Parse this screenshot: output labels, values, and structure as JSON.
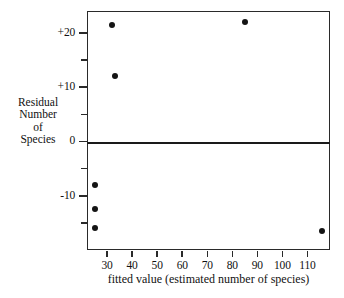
{
  "chart_data": {
    "type": "scatter",
    "title": "",
    "xlabel": "fitted value (estimated number of species)",
    "ylabel": "Residual Number of Species",
    "ylabel_lines": [
      "Residual",
      "Number",
      "of",
      "Species"
    ],
    "xlim": [
      22,
      119
    ],
    "ylim": [
      -20,
      24
    ],
    "grid": false,
    "legend": null,
    "zero_line": 0,
    "x_ticks": [
      30,
      40,
      50,
      60,
      70,
      80,
      90,
      100,
      110
    ],
    "x_tick_labels": [
      "30",
      "40",
      "50",
      "60",
      "70",
      "80",
      "90",
      "100",
      "110"
    ],
    "y_ticks": [
      20,
      15,
      10,
      5,
      0,
      -5,
      -10,
      -15
    ],
    "y_tick_labels": [
      "+20",
      "",
      "+10",
      "",
      "0",
      "",
      "-10",
      ""
    ],
    "y_labeled_ticks": [
      {
        "value": 20,
        "label": "+20"
      },
      {
        "value": 10,
        "label": "+10"
      },
      {
        "value": 0,
        "label": "0"
      },
      {
        "value": -10,
        "label": "-10"
      }
    ],
    "points": [
      {
        "x": 32,
        "y": 21.5
      },
      {
        "x": 85,
        "y": 22.0
      },
      {
        "x": 33,
        "y": 12.0
      },
      {
        "x": 25,
        "y": -8.0
      },
      {
        "x": 25,
        "y": -12.5
      },
      {
        "x": 25,
        "y": -16.0
      },
      {
        "x": 116,
        "y": -16.5
      }
    ],
    "colors": {
      "point": "#141414",
      "axis": "#2a2a2a",
      "zero_line": "#1a1a1a",
      "background": "#ffffff"
    }
  }
}
